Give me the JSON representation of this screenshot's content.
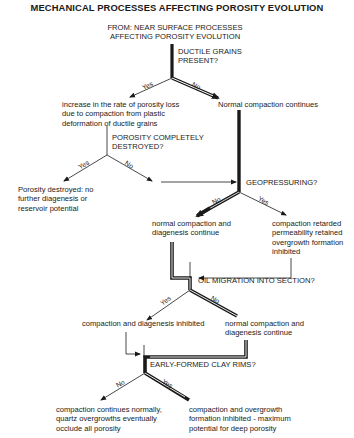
{
  "title": "MECHANICAL PROCESSES AFFECTING POROSITY EVOLUTION",
  "start": {
    "line1": "FROM:  NEAR SURFACE PROCESSES",
    "line2": "AFFECTING POROSITY EVOLUTION"
  },
  "decisions": {
    "ductile": {
      "line1": "DUCTILE GRAINS",
      "line2": "PRESENT?"
    },
    "porosity_destroyed": {
      "line1": "POROSITY COMPLETELY",
      "line2": "DESTROYED?"
    },
    "geopressuring": {
      "line1": "GEOPRESSURING?"
    },
    "oil_migration": {
      "line1": "OIL MIGRATION INTO SECTION?"
    },
    "clay_rims": {
      "line1": "EARLY-FORMED CLAY RIMS?"
    }
  },
  "outcomes": {
    "ductile_yes": {
      "line1": "increase in the rate of porosity loss",
      "line2": "due to compaction from plastic",
      "line3": "deformation of ductile grains"
    },
    "ductile_no": {
      "line1": "Normal compaction continues"
    },
    "destroyed_yes": {
      "line1": "Porosity destroyed: no",
      "line2": "further diagenesis or",
      "line3": "reservoir potential"
    },
    "geo_no": {
      "line1": "normal compaction and",
      "line2": "diagenesis continue"
    },
    "geo_yes": {
      "line1": "compaction retarded",
      "line2": "permeability retained",
      "line3": "overgrowth formation",
      "line4": "inhibited"
    },
    "oil_yes": {
      "line1": "compaction and diagenesis inhibited"
    },
    "oil_no": {
      "line1": "normal compaction and",
      "line2": "diagenesis continue"
    },
    "clay_no": {
      "line1": "compaction continues normally,",
      "line2": "quartz overgrowths eventually",
      "line3": "occlude all porosity"
    },
    "clay_yes": {
      "line1": "compaction and overgrowth",
      "line2": "formation inhibited - maximum",
      "line3": "potential for deep porosity"
    }
  },
  "branch_labels": {
    "yes": "Yes",
    "no": "No"
  },
  "colors": {
    "line": "#1a1a1a",
    "background": "#ffffff"
  }
}
